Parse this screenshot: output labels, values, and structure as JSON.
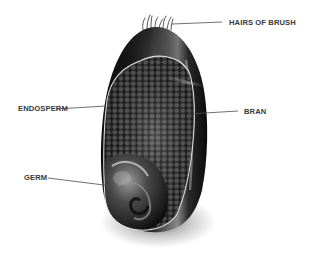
{
  "diagram": {
    "labels": {
      "hairs_of_brush": "HAIRS OF BRUSH",
      "endosperm": "ENDOSPERM",
      "bran": "BRAN",
      "germ": "GERM"
    },
    "colors": {
      "background": "#ffffff",
      "label_text": "#3a3a3a",
      "leader_line": "#4a4a4a",
      "kernel_dark": "#141414",
      "kernel_highlight": "#bdbdbd",
      "endosperm_border": "#d8d8d8",
      "endosperm_cell": "#5a5a5a"
    }
  }
}
